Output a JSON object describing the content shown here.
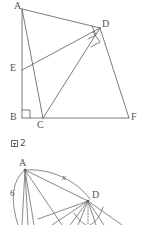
{
  "page": {
    "background": "#ffffff",
    "stroke_color": "#6b6b6b",
    "text_color": "#555555",
    "width": 143,
    "height": 225
  },
  "figure_top": {
    "caption": "図 2",
    "caption_text_only": "2",
    "vertices": [
      {
        "name": "A",
        "label": "A",
        "x": 22,
        "y": 9,
        "label_x": 14,
        "label_y": 1
      },
      {
        "name": "B",
        "label": "B",
        "x": 22,
        "y": 118,
        "label_x": 11,
        "label_y": 113
      },
      {
        "name": "C",
        "label": "C",
        "x": 43,
        "y": 118,
        "label_x": 38,
        "label_y": 120
      },
      {
        "name": "D",
        "label": "D",
        "x": 100,
        "y": 28,
        "label_x": 103,
        "label_y": 20
      },
      {
        "name": "E",
        "label": "E",
        "x": 22,
        "y": 70,
        "label_x": 11,
        "label_y": 64
      },
      {
        "name": "F",
        "label": "F",
        "x": 129,
        "y": 118,
        "label_x": 131,
        "label_y": 113
      }
    ],
    "segments": [
      {
        "from": "A",
        "to": "B"
      },
      {
        "from": "A",
        "to": "D"
      },
      {
        "from": "A",
        "to": "C"
      },
      {
        "from": "B",
        "to": "F"
      },
      {
        "from": "E",
        "to": "D"
      },
      {
        "from": "D",
        "to": "C"
      },
      {
        "from": "D",
        "to": "F"
      }
    ],
    "right_angles": [
      {
        "at": "B",
        "note": "square at B between BA and BF"
      },
      {
        "at": "D",
        "note": "square at D on ED / DC"
      },
      {
        "at": "D2",
        "note": "second square at D on AD / DF"
      }
    ]
  },
  "figure_bottom": {
    "vertices": [
      {
        "name": "A",
        "label": "A",
        "x": 25,
        "y": 170,
        "label_x": 19,
        "label_y": 159
      },
      {
        "name": "D",
        "label": "D",
        "x": 88,
        "y": 201,
        "label_x": 92,
        "label_y": 192
      }
    ],
    "length_labels": [
      {
        "name": "x",
        "text": "x",
        "x": 62,
        "y": 174
      },
      {
        "name": "6",
        "text": "6",
        "x": 11,
        "y": 189
      }
    ],
    "cropped": true
  }
}
